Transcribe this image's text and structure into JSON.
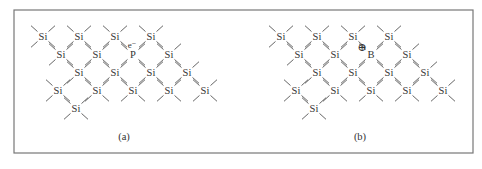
{
  "figure": {
    "frame": {
      "x": 14,
      "y": 10,
      "width": 459,
      "height": 143,
      "stroke": "#777777"
    },
    "panels": [
      {
        "id": "a",
        "caption": "(a)",
        "caption_pos": [
          124,
          140
        ],
        "dopant": {
          "symbol": "P",
          "carrier": "e⁻",
          "carrier_type": "electron"
        },
        "atoms": [
          {
            "s": "Si",
            "x": 43,
            "y": 40
          },
          {
            "s": "Si",
            "x": 79,
            "y": 40
          },
          {
            "s": "Si",
            "x": 115,
            "y": 40
          },
          {
            "s": "Si",
            "x": 151,
            "y": 40
          },
          {
            "s": "Si",
            "x": 61,
            "y": 58
          },
          {
            "s": "Si",
            "x": 97,
            "y": 58
          },
          {
            "s": "P",
            "x": 133,
            "y": 58
          },
          {
            "s": "Si",
            "x": 169,
            "y": 58
          },
          {
            "s": "Si",
            "x": 79,
            "y": 76
          },
          {
            "s": "Si",
            "x": 115,
            "y": 76
          },
          {
            "s": "Si",
            "x": 151,
            "y": 76
          },
          {
            "s": "Si",
            "x": 187,
            "y": 76
          },
          {
            "s": "Si",
            "x": 58,
            "y": 94
          },
          {
            "s": "Si",
            "x": 97,
            "y": 94
          },
          {
            "s": "Si",
            "x": 133,
            "y": 94
          },
          {
            "s": "Si",
            "x": 169,
            "y": 94
          },
          {
            "s": "Si",
            "x": 205,
            "y": 94
          },
          {
            "s": "Si",
            "x": 76,
            "y": 112
          }
        ],
        "marker": {
          "text": "e⁻",
          "x": 132,
          "y": 48
        }
      },
      {
        "id": "b",
        "caption": "(b)",
        "caption_pos": [
          360,
          140
        ],
        "dopant": {
          "symbol": "B",
          "carrier": "⊕",
          "carrier_type": "hole"
        },
        "atoms": [
          {
            "s": "Si",
            "x": 281,
            "y": 40
          },
          {
            "s": "Si",
            "x": 317,
            "y": 40
          },
          {
            "s": "Si",
            "x": 353,
            "y": 40
          },
          {
            "s": "Si",
            "x": 389,
            "y": 40
          },
          {
            "s": "Si",
            "x": 299,
            "y": 58
          },
          {
            "s": "Si",
            "x": 335,
            "y": 58
          },
          {
            "s": "B",
            "x": 371,
            "y": 58
          },
          {
            "s": "Si",
            "x": 407,
            "y": 58
          },
          {
            "s": "Si",
            "x": 317,
            "y": 76
          },
          {
            "s": "Si",
            "x": 353,
            "y": 76
          },
          {
            "s": "Si",
            "x": 389,
            "y": 76
          },
          {
            "s": "Si",
            "x": 425,
            "y": 76
          },
          {
            "s": "Si",
            "x": 296,
            "y": 94
          },
          {
            "s": "Si",
            "x": 335,
            "y": 94
          },
          {
            "s": "Si",
            "x": 371,
            "y": 94
          },
          {
            "s": "Si",
            "x": 407,
            "y": 94
          },
          {
            "s": "Si",
            "x": 443,
            "y": 94
          },
          {
            "s": "Si",
            "x": 314,
            "y": 112
          }
        ],
        "marker": {
          "text": "⊕",
          "x": 362,
          "y": 51
        }
      }
    ]
  }
}
